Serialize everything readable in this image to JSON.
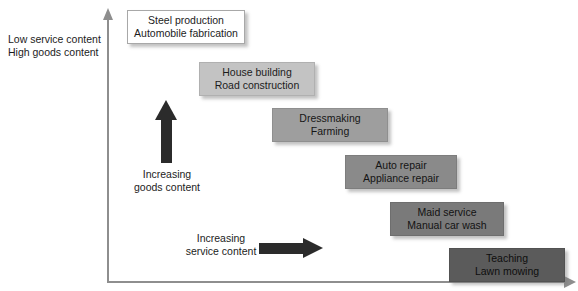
{
  "diagram": {
    "axes": {
      "vertical_label_line1": "Low service content",
      "vertical_label_line2": "High goods content",
      "axis_color": "#8e8e8e"
    },
    "arrows": [
      {
        "name": "increasing-goods-arrow",
        "direction": "up",
        "caption_line1": "Increasing",
        "caption_line2": "goods content",
        "color": "#2b2b2b"
      },
      {
        "name": "increasing-service-arrow",
        "direction": "right",
        "caption_line1": "Increasing",
        "caption_line2": "service content",
        "color": "#2b2b2b"
      }
    ],
    "boxes": [
      {
        "line1": "Steel production",
        "line2": "Automobile fabrication",
        "fill": "#ffffff",
        "tone": 0,
        "x": 127,
        "y": 10,
        "w": 118,
        "h": 34
      },
      {
        "line1": "House building",
        "line2": "Road construction",
        "fill": "#c3c3c3",
        "tone": 1,
        "x": 199,
        "y": 62,
        "w": 116,
        "h": 34
      },
      {
        "line1": "Dressmaking",
        "line2": "Farming",
        "fill": "#9e9e9e",
        "tone": 2,
        "x": 272,
        "y": 108,
        "w": 116,
        "h": 34
      },
      {
        "line1": "Auto repair",
        "line2": "Appliance repair",
        "fill": "#8a8a8a",
        "tone": 3,
        "x": 345,
        "y": 155,
        "w": 112,
        "h": 34
      },
      {
        "line1": "Maid service",
        "line2": "Manual car wash",
        "fill": "#7a7a7a",
        "tone": 4,
        "x": 390,
        "y": 202,
        "w": 114,
        "h": 34
      },
      {
        "line1": "Teaching",
        "line2": "Lawn mowing",
        "fill": "#5b5b5b",
        "tone": 6,
        "x": 449,
        "y": 248,
        "w": 116,
        "h": 34
      }
    ]
  }
}
